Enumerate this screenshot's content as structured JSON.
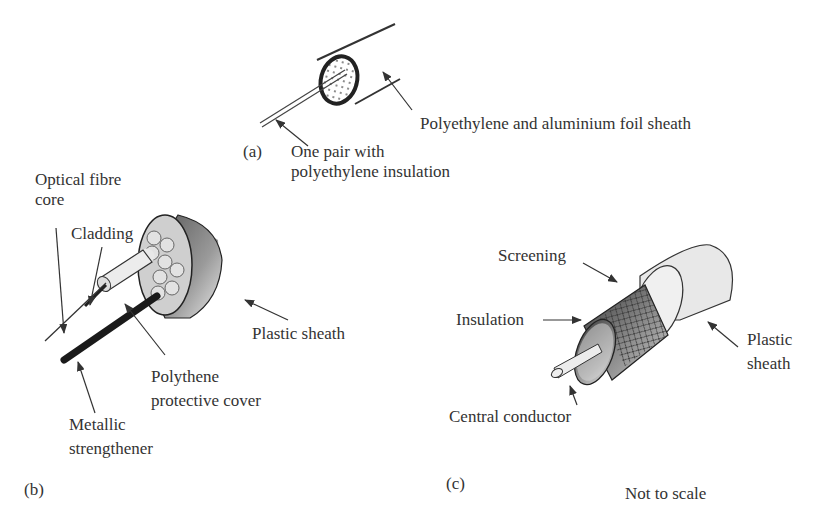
{
  "diagram": {
    "panels": {
      "a": {
        "tag": "(a)",
        "labels": {
          "sheath": "Polyethylene and aluminium foil sheath",
          "pair_line1": "One pair with",
          "pair_line2": "polyethylene insulation"
        }
      },
      "b": {
        "tag": "(b)",
        "labels": {
          "core_line1": "Optical fibre",
          "core_line2": "core",
          "cladding": "Cladding",
          "plastic_sheath": "Plastic sheath",
          "cover_line1": "Polythene",
          "cover_line2": "protective cover",
          "strength_line1": "Metallic",
          "strength_line2": "strengthener"
        }
      },
      "c": {
        "tag": "(c)",
        "labels": {
          "screening": "Screening",
          "insulation": "Insulation",
          "sheath_line1": "Plastic",
          "sheath_line2": "sheath",
          "conductor": "Central conductor"
        }
      }
    },
    "note": "Not to scale"
  }
}
